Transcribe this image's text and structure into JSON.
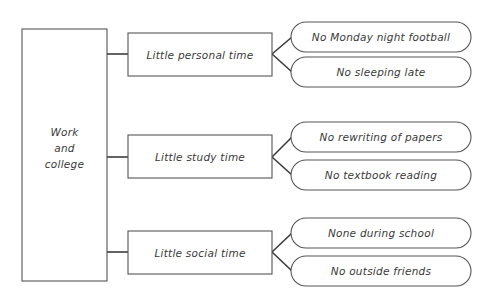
{
  "diagram": {
    "type": "tree-diagram",
    "title_text": "Work and college consequences tree",
    "root": {
      "lines": [
        "Work",
        "and",
        "college"
      ],
      "shape": "rectangle"
    },
    "branches": [
      {
        "label": "Little personal time",
        "shape": "rectangle",
        "leaves": [
          {
            "label": "No Monday night football",
            "shape": "rounded-rectangle"
          },
          {
            "label": "No sleeping late",
            "shape": "rounded-rectangle"
          }
        ]
      },
      {
        "label": "Little study time",
        "shape": "rectangle",
        "leaves": [
          {
            "label": "No rewriting of papers",
            "shape": "rounded-rectangle"
          },
          {
            "label": "No textbook reading",
            "shape": "rounded-rectangle"
          }
        ]
      },
      {
        "label": "Little social time",
        "shape": "rectangle",
        "leaves": [
          {
            "label": "None during school",
            "shape": "rounded-rectangle"
          },
          {
            "label": "No outside friends",
            "shape": "rounded-rectangle"
          }
        ]
      }
    ],
    "colors": {
      "background": "#ffffff",
      "box_stroke": "#555555",
      "connector_stroke": "#3c3c3c",
      "text": "#3a3a3a"
    }
  }
}
